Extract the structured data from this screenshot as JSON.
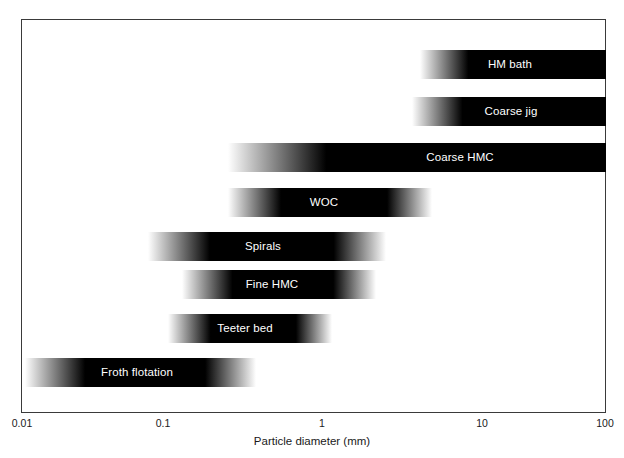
{
  "chart_data": {
    "type": "bar",
    "title": "",
    "subtitle": "",
    "xlabel": "Particle diameter (mm)",
    "ylabel": "",
    "xscale": "log",
    "xlim": [
      0.01,
      100
    ],
    "xticks": [
      0.01,
      0.1,
      1,
      10,
      100
    ],
    "xticklabels": [
      "0.01",
      "0.1",
      "1",
      "10",
      "100"
    ],
    "grid": false,
    "legend": null,
    "orientation": "horizontal",
    "note": "Horizontal range bars with soft gradient (feathered) ends indicating approximate operating size ranges of coal beneficiation devices on a logarithmic particle-diameter axis.",
    "categories": [
      "HM bath",
      "Coarse jig",
      "Coarse HMC",
      "WOC",
      "Spirals",
      "Fine HMC",
      "Teeter bed",
      "Froth flotation"
    ],
    "bars": [
      {
        "label": "HM bath",
        "x_start_mm": 4.0,
        "x_end_mm": 100.0,
        "x_core_start_mm": 6.5,
        "x_core_end_mm": 100.0,
        "left_feathered": true,
        "right_feathered": false,
        "px": {
          "left": 420,
          "right": 606,
          "top": 50,
          "height": 29
        },
        "label_center_px": 510
      },
      {
        "label": "Coarse jig",
        "x_start_mm": 3.3,
        "x_end_mm": 100.0,
        "x_core_start_mm": 6.0,
        "x_core_end_mm": 100.0,
        "left_feathered": true,
        "right_feathered": false,
        "px": {
          "left": 412,
          "right": 606,
          "top": 97,
          "height": 29
        },
        "label_center_px": 511
      },
      {
        "label": "Coarse HMC",
        "x_start_mm": 0.35,
        "x_end_mm": 100.0,
        "x_core_start_mm": 1.1,
        "x_core_end_mm": 100.0,
        "left_feathered": true,
        "right_feathered": false,
        "px": {
          "left": 228,
          "right": 606,
          "top": 143,
          "height": 29
        },
        "label_center_px": 460
      },
      {
        "label": "WOC",
        "x_start_mm": 0.35,
        "x_end_mm": 5.5,
        "x_core_start_mm": 0.8,
        "x_core_end_mm": 3.2,
        "left_feathered": true,
        "right_feathered": true,
        "px": {
          "left": 228,
          "right": 432,
          "top": 188,
          "height": 29
        },
        "label_center_px": 324
      },
      {
        "label": "Spirals",
        "x_start_mm": 0.1,
        "x_end_mm": 2.2,
        "x_core_start_mm": 0.25,
        "x_core_end_mm": 1.3,
        "left_feathered": true,
        "right_feathered": true,
        "px": {
          "left": 148,
          "right": 386,
          "top": 232,
          "height": 29
        },
        "label_center_px": 263
      },
      {
        "label": "Fine HMC",
        "x_start_mm": 0.17,
        "x_end_mm": 1.9,
        "x_core_start_mm": 0.35,
        "x_core_end_mm": 1.0,
        "left_feathered": true,
        "right_feathered": true,
        "px": {
          "left": 182,
          "right": 376,
          "top": 270,
          "height": 29
        },
        "label_center_px": 272
      },
      {
        "label": "Teeter bed",
        "x_start_mm": 0.13,
        "x_end_mm": 1.1,
        "x_core_start_mm": 0.25,
        "x_core_end_mm": 0.7,
        "left_feathered": true,
        "right_feathered": true,
        "px": {
          "left": 168,
          "right": 332,
          "top": 314,
          "height": 29
        },
        "label_center_px": 245
      },
      {
        "label": "Froth flotation",
        "x_start_mm": 0.012,
        "x_end_mm": 0.42,
        "x_core_start_mm": 0.03,
        "x_core_end_mm": 0.23,
        "left_feathered": true,
        "right_feathered": true,
        "px": {
          "left": 25,
          "right": 256,
          "top": 358,
          "height": 29
        },
        "label_center_px": 137
      }
    ]
  },
  "axis": {
    "xlabel": "Particle diameter (mm)",
    "ticks": [
      {
        "label": "0.01",
        "px": 22
      },
      {
        "label": "0.1",
        "px": 163
      },
      {
        "label": "1",
        "px": 322
      },
      {
        "label": "10",
        "px": 482
      },
      {
        "label": "100",
        "px": 605
      }
    ]
  },
  "colors": {
    "bar_dark": "#000000",
    "bar_fade": "#ffffff",
    "frame": "#3a3a3a",
    "text": "#1a1a1a",
    "bar_text": "#ffffff",
    "background": "#ffffff"
  }
}
